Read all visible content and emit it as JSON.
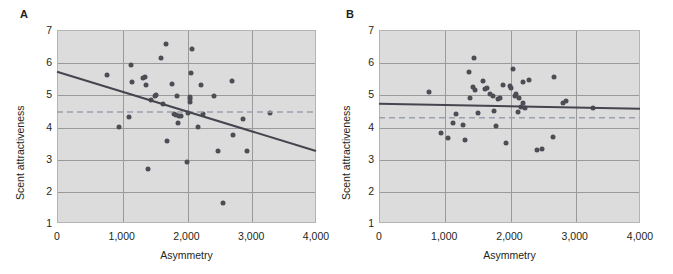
{
  "figure": {
    "panels": [
      {
        "label": "A",
        "xlabel": "Asymmetry",
        "ylabel": "Scent attractiveness"
      },
      {
        "label": "B",
        "xlabel": "Asymmetry",
        "ylabel": "Scent attractiveness"
      }
    ],
    "colors": {
      "plot_background": "#dcdcdc",
      "gridline": "#9a9a9a",
      "point": "#4d4d55",
      "regression_line": "#45454f",
      "mean_line": "#9aa0ae",
      "text": "#231f20",
      "page_background": "#ffffff"
    }
  },
  "chart_data": [
    {
      "type": "scatter",
      "panel": "A",
      "title": "",
      "xlabel": "Asymmetry",
      "ylabel": "Scent attractiveness",
      "xlim": [
        0,
        4000
      ],
      "ylim": [
        1,
        7
      ],
      "xticks": [
        0,
        1000,
        2000,
        3000,
        4000
      ],
      "xticklabels": [
        "0",
        "1,000",
        "2,000",
        "3,000",
        "4,000"
      ],
      "yticks": [
        1,
        2,
        3,
        4,
        5,
        6,
        7
      ],
      "yticklabels": [
        "1",
        "2",
        "3",
        "4",
        "5",
        "6",
        "7"
      ],
      "grid": true,
      "legend": "none",
      "points": [
        [
          770,
          5.6
        ],
        [
          960,
          4.0
        ],
        [
          1110,
          4.28
        ],
        [
          1150,
          5.9
        ],
        [
          1160,
          5.38
        ],
        [
          1330,
          5.5
        ],
        [
          1360,
          5.55
        ],
        [
          1370,
          5.28
        ],
        [
          1400,
          2.67
        ],
        [
          1450,
          4.82
        ],
        [
          1510,
          4.95
        ],
        [
          1530,
          4.98
        ],
        [
          1600,
          6.12
        ],
        [
          1640,
          4.7
        ],
        [
          1690,
          6.58
        ],
        [
          1700,
          3.56
        ],
        [
          1780,
          5.33
        ],
        [
          1800,
          4.38
        ],
        [
          1840,
          4.36
        ],
        [
          1850,
          4.95
        ],
        [
          1870,
          4.12
        ],
        [
          1890,
          4.34
        ],
        [
          1910,
          4.33
        ],
        [
          2000,
          2.9
        ],
        [
          2020,
          4.43
        ],
        [
          2050,
          4.75
        ],
        [
          2060,
          4.85
        ],
        [
          2060,
          4.93
        ],
        [
          2070,
          5.67
        ],
        [
          2080,
          6.42
        ],
        [
          2180,
          3.97
        ],
        [
          2220,
          5.3
        ],
        [
          2250,
          4.4
        ],
        [
          2430,
          4.95
        ],
        [
          2480,
          3.25
        ],
        [
          2560,
          1.62
        ],
        [
          2700,
          5.4
        ],
        [
          2720,
          3.75
        ],
        [
          2880,
          4.24
        ],
        [
          2930,
          3.24
        ],
        [
          3290,
          4.43
        ]
      ],
      "regression_line": {
        "style": "solid",
        "x": [
          0,
          4000
        ],
        "y": [
          5.7,
          3.24
        ],
        "slope_sign": "negative"
      },
      "mean_line": {
        "style": "dashed",
        "y": 4.45,
        "label": "mean scent attractiveness"
      }
    },
    {
      "type": "scatter",
      "panel": "B",
      "title": "",
      "xlabel": "Asymmetry",
      "ylabel": "Scent attractiveness",
      "xlim": [
        0,
        4000
      ],
      "ylim": [
        1,
        7
      ],
      "xticks": [
        0,
        1000,
        2000,
        3000,
        4000
      ],
      "xticklabels": [
        "0",
        "1,000",
        "2,000",
        "3,000",
        "4,000"
      ],
      "yticks": [
        1,
        2,
        3,
        4,
        5,
        6,
        7
      ],
      "yticklabels": [
        "1",
        "2",
        "3",
        "4",
        "5",
        "6",
        "7"
      ],
      "grid": true,
      "legend": "none",
      "points": [
        [
          770,
          5.07
        ],
        [
          950,
          3.8
        ],
        [
          1050,
          3.63
        ],
        [
          1140,
          4.12
        ],
        [
          1180,
          4.38
        ],
        [
          1290,
          4.06
        ],
        [
          1320,
          3.58
        ],
        [
          1380,
          5.7
        ],
        [
          1400,
          4.88
        ],
        [
          1440,
          5.22
        ],
        [
          1450,
          6.12
        ],
        [
          1470,
          5.15
        ],
        [
          1520,
          4.43
        ],
        [
          1600,
          5.42
        ],
        [
          1620,
          5.18
        ],
        [
          1650,
          5.2
        ],
        [
          1700,
          5.0
        ],
        [
          1740,
          4.96
        ],
        [
          1770,
          4.47
        ],
        [
          1790,
          4.02
        ],
        [
          1820,
          4.86
        ],
        [
          1850,
          4.88
        ],
        [
          1900,
          5.3
        ],
        [
          1950,
          3.48
        ],
        [
          2000,
          5.25
        ],
        [
          2020,
          5.2
        ],
        [
          2050,
          5.78
        ],
        [
          2080,
          4.95
        ],
        [
          2100,
          5.0
        ],
        [
          2130,
          4.46
        ],
        [
          2150,
          4.9
        ],
        [
          2180,
          4.6
        ],
        [
          2200,
          4.72
        ],
        [
          2210,
          5.38
        ],
        [
          2230,
          4.58
        ],
        [
          2300,
          5.45
        ],
        [
          2420,
          3.26
        ],
        [
          2500,
          3.29
        ],
        [
          2660,
          3.68
        ],
        [
          2680,
          5.53
        ],
        [
          2820,
          4.72
        ],
        [
          2870,
          4.78
        ],
        [
          3280,
          4.57
        ]
      ],
      "regression_line": {
        "style": "solid",
        "x": [
          0,
          4000
        ],
        "y": [
          4.71,
          4.55
        ],
        "slope_sign": "flat"
      },
      "mean_line": {
        "style": "dashed",
        "y": 4.27,
        "label": "mean scent attractiveness"
      }
    }
  ]
}
